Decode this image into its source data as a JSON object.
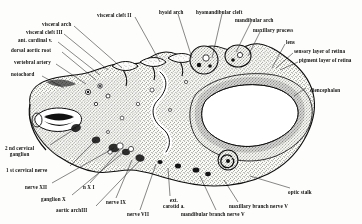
{
  "figure": {
    "stipple_color": "#2b2b2b",
    "ink_color": "#111111",
    "paper_color": "#fdfdfb"
  },
  "labels": {
    "top_left": [
      {
        "id": "visceral-arch",
        "text": "visceral arch",
        "x": 42,
        "y": 22
      },
      {
        "id": "visceral-cleft-3",
        "text": "visceral  cleft III",
        "x": 26,
        "y": 30
      },
      {
        "id": "ant-cardinal-v",
        "text": "ant. cardinal v.",
        "x": 18,
        "y": 38
      },
      {
        "id": "dorsal-aortic-root",
        "text": "dorsal aortic root",
        "x": 11,
        "y": 48
      },
      {
        "id": "vertebral-artery",
        "text": "vertebral artery",
        "x": 14,
        "y": 60
      },
      {
        "id": "notochord",
        "text": "notochord",
        "x": 11,
        "y": 72
      }
    ],
    "top_center": [
      {
        "id": "visceral-cleft-2",
        "text": "visceral  cleft II",
        "x": 97,
        "y": 13
      },
      {
        "id": "hyoid-arch",
        "text": "hyoid arch",
        "x": 159,
        "y": 10
      },
      {
        "id": "hyomandibular-cleft",
        "text": "hyomandibular cleft",
        "x": 196,
        "y": 10
      },
      {
        "id": "mandibular-arch",
        "text": "mandibular arch",
        "x": 235,
        "y": 18
      },
      {
        "id": "maxillary-process",
        "text": "maxillary process",
        "x": 253,
        "y": 28
      }
    ],
    "top_right": [
      {
        "id": "lens",
        "text": "lens",
        "x": 286,
        "y": 40
      },
      {
        "id": "sensory-layer-of-retina",
        "text": "sensory layer of retina",
        "x": 294,
        "y": 49
      },
      {
        "id": "pigment-layer-of-retina",
        "text": "pigment layer of retina",
        "x": 299,
        "y": 58
      }
    ],
    "right": [
      {
        "id": "diencephalon",
        "text": "diencephalon",
        "x": 310,
        "y": 88
      }
    ],
    "bottom_left": [
      {
        "id": "2nd-cervical-ganglion",
        "text": "2 nd cervical\nganglion",
        "x": 5,
        "y": 146
      },
      {
        "id": "1st-cervical-nerve",
        "text": "1 st cervical nerve",
        "x": 6,
        "y": 168
      },
      {
        "id": "nerve-xii",
        "text": "nerve XII",
        "x": 25,
        "y": 185
      },
      {
        "id": "ganglion-x",
        "text": "ganglion X",
        "x": 41,
        "y": 197
      },
      {
        "id": "n-x-i",
        "text": "n X I",
        "x": 83,
        "y": 185
      },
      {
        "id": "aortic-arch-iii",
        "text": "aortic archIII",
        "x": 56,
        "y": 208
      }
    ],
    "bottom_center": [
      {
        "id": "nerve-ix",
        "text": "nerve IX",
        "x": 106,
        "y": 200
      },
      {
        "id": "nerve-vii",
        "text": "nerve VII",
        "x": 127,
        "y": 212
      },
      {
        "id": "ext-carotid",
        "text": "ext.\ncarotid a.",
        "x": 163,
        "y": 198
      }
    ],
    "bottom_right": [
      {
        "id": "mandibular-branch-nerve-v",
        "text": "mandibular branch nerve V",
        "x": 181,
        "y": 212
      },
      {
        "id": "maxillary-branch-nerve-v",
        "text": "maxillary  branch nerve V",
        "x": 229,
        "y": 204
      },
      {
        "id": "optic-stalk",
        "text": "optic stalk",
        "x": 288,
        "y": 190
      }
    ]
  },
  "leaders": [
    {
      "id": "ld-visceral-arch",
      "x1": 74,
      "y1": 26,
      "x2": 122,
      "y2": 68
    },
    {
      "id": "ld-visceral-cleft-3",
      "x1": 64,
      "y1": 34,
      "x2": 108,
      "y2": 70
    },
    {
      "id": "ld-ant-cardinal-v",
      "x1": 58,
      "y1": 42,
      "x2": 100,
      "y2": 75
    },
    {
      "id": "ld-dorsal-aortic-root",
      "x1": 62,
      "y1": 52,
      "x2": 96,
      "y2": 80
    },
    {
      "id": "ld-vertebral-artery",
      "x1": 56,
      "y1": 64,
      "x2": 86,
      "y2": 84
    },
    {
      "id": "ld-notochord",
      "x1": 42,
      "y1": 76,
      "x2": 64,
      "y2": 88
    },
    {
      "id": "ld-visceral-cleft-2",
      "x1": 135,
      "y1": 17,
      "x2": 160,
      "y2": 62
    },
    {
      "id": "ld-hyoid-arch",
      "x1": 178,
      "y1": 14,
      "x2": 192,
      "y2": 58
    },
    {
      "id": "ld-hyomandibular-cleft",
      "x1": 222,
      "y1": 14,
      "x2": 212,
      "y2": 58
    },
    {
      "id": "ld-mandibular-arch",
      "x1": 251,
      "y1": 22,
      "x2": 236,
      "y2": 52
    },
    {
      "id": "ld-maxillary-process",
      "x1": 260,
      "y1": 32,
      "x2": 248,
      "y2": 56
    },
    {
      "id": "ld-lens",
      "x1": 285,
      "y1": 44,
      "x2": 272,
      "y2": 68
    },
    {
      "id": "ld-sensory-retina",
      "x1": 293,
      "y1": 53,
      "x2": 276,
      "y2": 68
    },
    {
      "id": "ld-pigment-retina",
      "x1": 298,
      "y1": 62,
      "x2": 280,
      "y2": 70
    },
    {
      "id": "ld-diencephalon",
      "x1": 306,
      "y1": 88,
      "x2": 294,
      "y2": 96
    },
    {
      "id": "ld-2nd-cerv-ganglion",
      "x1": 50,
      "y1": 145,
      "x2": 76,
      "y2": 128
    },
    {
      "id": "ld-1st-cerv-nerve",
      "x1": 70,
      "y1": 166,
      "x2": 96,
      "y2": 140
    },
    {
      "id": "ld-nerve-xii",
      "x1": 52,
      "y1": 183,
      "x2": 114,
      "y2": 148
    },
    {
      "id": "ld-ganglion-x",
      "x1": 72,
      "y1": 195,
      "x2": 124,
      "y2": 152
    },
    {
      "id": "ld-n-x-i",
      "x1": 90,
      "y1": 183,
      "x2": 120,
      "y2": 150
    },
    {
      "id": "ld-aortic-arch-iii",
      "x1": 96,
      "y1": 206,
      "x2": 142,
      "y2": 158
    },
    {
      "id": "ld-nerve-ix",
      "x1": 116,
      "y1": 198,
      "x2": 132,
      "y2": 160
    },
    {
      "id": "ld-nerve-vii",
      "x1": 140,
      "y1": 210,
      "x2": 156,
      "y2": 164
    },
    {
      "id": "ld-ext-carotid",
      "x1": 170,
      "y1": 196,
      "x2": 168,
      "y2": 168
    },
    {
      "id": "ld-mandibular-branch",
      "x1": 216,
      "y1": 210,
      "x2": 200,
      "y2": 176
    },
    {
      "id": "ld-maxillary-branch",
      "x1": 238,
      "y1": 202,
      "x2": 224,
      "y2": 180
    },
    {
      "id": "ld-optic-stalk",
      "x1": 290,
      "y1": 188,
      "x2": 250,
      "y2": 176
    }
  ]
}
